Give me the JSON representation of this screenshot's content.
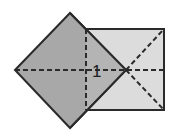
{
  "diagram": {
    "type": "geometric-figure",
    "label": "1",
    "colors": {
      "background": "#ffffff",
      "square_fill": "#dcdcdc",
      "diamond_fill": "#a8a8a8",
      "stroke": "#2a2a2a"
    },
    "shapes": [
      {
        "name": "square",
        "description": "axis-aligned square with dashed diagonals from center-right point to right corners"
      },
      {
        "name": "diamond",
        "description": "rotated square (45°) overlapping left half of square, darker fill"
      }
    ]
  }
}
